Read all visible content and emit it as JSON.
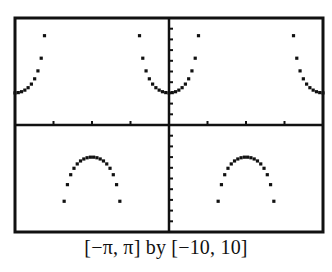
{
  "caption": "[−π, π] by [−10, 10]",
  "chart_data": {
    "type": "scatter",
    "title": "",
    "function": "y = 3 sec(2x)",
    "xlabel": "",
    "ylabel": "",
    "xlim": [
      -3.14159,
      3.14159
    ],
    "ylim": [
      -10,
      10
    ],
    "x_tick_step": 0.785398,
    "y_tick_step": 1,
    "grid": false,
    "legend": null,
    "window_caption": "[−π, π] by [−10, 10]",
    "amplitude": 3,
    "frequency": 2,
    "sample_count": 95,
    "colors": {
      "points": "#111111",
      "axes": "#111111",
      "frame": "#111111",
      "background": "#ffffff"
    }
  },
  "frame": {
    "left": 15,
    "top": 18,
    "right": 323,
    "bottom": 232
  }
}
